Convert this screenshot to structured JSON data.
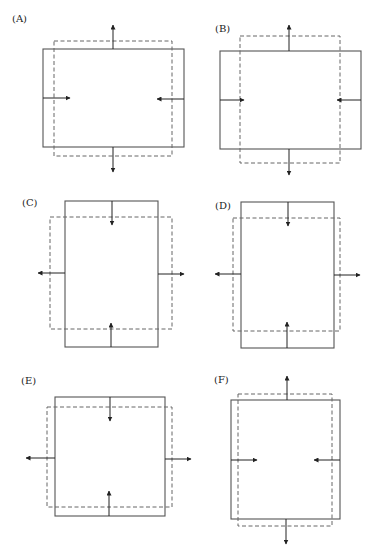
{
  "figure": {
    "legend": {
      "solid": "original shape",
      "dashed": "deformed shape"
    },
    "colors": {
      "solid_stroke": "#555555",
      "dashed_stroke": "#666666",
      "arrow": "#222222"
    },
    "panels": [
      {
        "label": "(A)",
        "label_pos": [
          12,
          22
        ],
        "solid": [
          43,
          49,
          141,
          98
        ],
        "dashed": [
          54,
          41,
          118,
          115
        ],
        "arrows": [
          {
            "x1": 113,
            "y1": 49,
            "x2": 113,
            "y2": 25
          },
          {
            "x1": 113,
            "y1": 147,
            "x2": 113,
            "y2": 172
          },
          {
            "x1": 43,
            "y1": 98,
            "x2": 70,
            "y2": 98
          },
          {
            "x1": 184,
            "y1": 99,
            "x2": 157,
            "y2": 99
          }
        ]
      },
      {
        "label": "(B)",
        "label_pos": [
          215,
          32
        ],
        "solid": [
          220,
          51,
          141,
          98
        ],
        "dashed": [
          240,
          36,
          100,
          127
        ],
        "arrows": [
          {
            "x1": 289,
            "y1": 51,
            "x2": 289,
            "y2": 25
          },
          {
            "x1": 289,
            "y1": 149,
            "x2": 289,
            "y2": 175
          },
          {
            "x1": 220,
            "y1": 100,
            "x2": 244,
            "y2": 100
          },
          {
            "x1": 361,
            "y1": 100,
            "x2": 337,
            "y2": 100
          }
        ]
      },
      {
        "label": "(C)",
        "label_pos": [
          22,
          206
        ],
        "solid": [
          65,
          201,
          93,
          146
        ],
        "dashed": [
          50,
          217,
          122,
          112
        ],
        "arrows": [
          {
            "x1": 112,
            "y1": 201,
            "x2": 112,
            "y2": 225
          },
          {
            "x1": 111,
            "y1": 347,
            "x2": 111,
            "y2": 323
          },
          {
            "x1": 65,
            "y1": 273,
            "x2": 38,
            "y2": 273
          },
          {
            "x1": 158,
            "y1": 274,
            "x2": 184,
            "y2": 274
          }
        ]
      },
      {
        "label": "(D)",
        "label_pos": [
          215,
          209
        ],
        "solid": [
          241,
          202,
          93,
          146
        ],
        "dashed": [
          233,
          218,
          107,
          113
        ],
        "arrows": [
          {
            "x1": 288,
            "y1": 202,
            "x2": 288,
            "y2": 226
          },
          {
            "x1": 287,
            "y1": 348,
            "x2": 287,
            "y2": 322
          },
          {
            "x1": 241,
            "y1": 274,
            "x2": 215,
            "y2": 274
          },
          {
            "x1": 334,
            "y1": 275,
            "x2": 360,
            "y2": 275
          }
        ]
      },
      {
        "label": "(E)",
        "label_pos": [
          21,
          384
        ],
        "solid": [
          55,
          397,
          110,
          119
        ],
        "dashed": [
          47,
          407,
          125,
          100
        ],
        "arrows": [
          {
            "x1": 110,
            "y1": 397,
            "x2": 110,
            "y2": 421
          },
          {
            "x1": 109,
            "y1": 516,
            "x2": 109,
            "y2": 491
          },
          {
            "x1": 55,
            "y1": 458,
            "x2": 26,
            "y2": 458
          },
          {
            "x1": 165,
            "y1": 459,
            "x2": 191,
            "y2": 459
          }
        ]
      },
      {
        "label": "(F)",
        "label_pos": [
          214,
          383
        ],
        "solid": [
          231,
          400,
          109,
          119
        ],
        "dashed": [
          238,
          394,
          94,
          132
        ],
        "arrows": [
          {
            "x1": 287,
            "y1": 400,
            "x2": 287,
            "y2": 376
          },
          {
            "x1": 286,
            "y1": 519,
            "x2": 286,
            "y2": 544
          },
          {
            "x1": 231,
            "y1": 460,
            "x2": 257,
            "y2": 460
          },
          {
            "x1": 340,
            "y1": 460,
            "x2": 314,
            "y2": 460
          }
        ]
      }
    ]
  }
}
